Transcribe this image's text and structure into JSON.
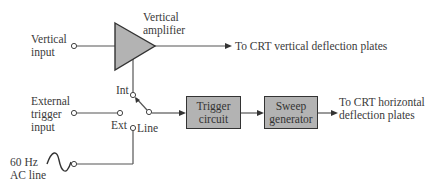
{
  "diagram": {
    "inputs": {
      "vertical_input": [
        "Vertical",
        "input"
      ],
      "external_trigger_input": [
        "External",
        "trigger",
        "input"
      ],
      "ac_line": [
        "60 Hz",
        "AC line"
      ]
    },
    "blocks": {
      "vertical_amplifier": [
        "Vertical",
        "amplifier"
      ],
      "trigger_circuit": [
        "Trigger",
        "circuit"
      ],
      "sweep_generator": [
        "Sweep",
        "generator"
      ]
    },
    "switch": {
      "int": "Int",
      "ext": "Ext",
      "line": "Line",
      "selected": "Int"
    },
    "outputs": {
      "vertical": "To CRT vertical deflection plates",
      "horizontal": [
        "To CRT horizontal",
        "deflection plates"
      ]
    },
    "colors": {
      "block_fill": "#b3b3b3",
      "line": "#555555"
    }
  }
}
